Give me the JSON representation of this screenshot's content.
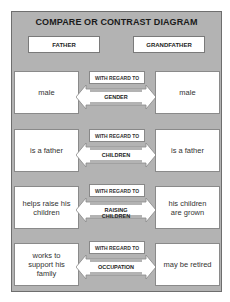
{
  "title": "COMPARE OR CONTRAST DIAGRAM",
  "left_heading": "FATHER",
  "right_heading": "GRANDFATHER",
  "connector_label": "WITH REGARD TO",
  "rows": [
    {
      "left": "male",
      "attribute": "GENDER",
      "right": "male"
    },
    {
      "left": "is a father",
      "attribute": "CHILDREN",
      "right": "is a father"
    },
    {
      "left": "helps raise his children",
      "attribute": "RAISING CHILDREN",
      "right": "his children are grown"
    },
    {
      "left": "works to support his family",
      "attribute": "OCCUPATION",
      "right": "may be retired"
    }
  ]
}
